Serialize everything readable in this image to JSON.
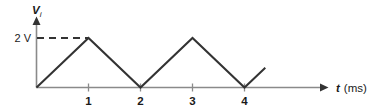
{
  "chart_data": {
    "type": "line",
    "title": "",
    "subtitle": "",
    "xlabel": "t (ms)",
    "xlabel_symbol": "t",
    "xlabel_unit": "(ms)",
    "ylabel": "Vi",
    "ylabel_symbol": "V",
    "ylabel_subscript": "i",
    "grid": false,
    "legend": false,
    "xlim": [
      0,
      5.5
    ],
    "ylim": [
      0,
      2.6
    ],
    "xticks": [
      1,
      2,
      3,
      4
    ],
    "xticklabels": [
      "1",
      "2",
      "3",
      "4"
    ],
    "yticks": [
      2
    ],
    "yticklabels": [
      "2 V"
    ],
    "series": [
      {
        "name": "Vi",
        "x": [
          0,
          1,
          2,
          3,
          4,
          4.4
        ],
        "values": [
          0,
          2,
          0,
          2,
          0,
          0.8
        ]
      }
    ],
    "annotations": [
      {
        "name": "peak-level-dashed-line",
        "type": "dashed-horizontal",
        "y": 2,
        "x_from": 0,
        "x_to": 1,
        "label": "2 V"
      }
    ],
    "colors": {
      "waveform": "#333333",
      "axis": "#8a8a8a",
      "dashed": "#333333",
      "text": "#1a1a1a",
      "background": "#ffffff"
    }
  },
  "labels": {
    "y_axis_symbol": "V",
    "y_axis_subscript": "i",
    "y_level_label": "2 V",
    "x_axis_symbol": "t",
    "x_axis_unit": "(ms)",
    "tick_1": "1",
    "tick_2": "2",
    "tick_3": "3",
    "tick_4": "4"
  }
}
